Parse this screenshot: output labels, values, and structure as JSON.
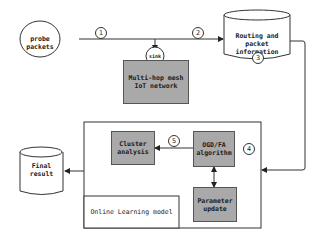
{
  "diagram": {
    "nodes": {
      "probe": {
        "label": "probe packets"
      },
      "sink": {
        "label": "sink"
      },
      "mesh": {
        "label": "Multi-hop mesh\nIoT network"
      },
      "routing": {
        "label": "Routing and packet\ninformation"
      },
      "cluster": {
        "label": "Cluster\nanalysis"
      },
      "ogd": {
        "label": "OGD/FA\nalgorithm"
      },
      "param": {
        "label": "Parameter\nupdate"
      },
      "final": {
        "label": "Final\nresult"
      },
      "model": {
        "label": "Online Learning model"
      }
    },
    "steps": {
      "s1": "1",
      "s2": "2",
      "s3": "3",
      "s4": "4",
      "s5": "5"
    },
    "edges": [
      {
        "from": "probe",
        "to": "sink",
        "step": "1"
      },
      {
        "from": "sink",
        "to": "routing",
        "step": "2"
      },
      {
        "from": "routing",
        "to": "model",
        "step": "4"
      },
      {
        "from": "ogd",
        "to": "cluster",
        "step": "5"
      },
      {
        "from": "ogd",
        "to": "param",
        "bidirectional": true
      },
      {
        "from": "model",
        "to": "final"
      }
    ],
    "colors": {
      "box_fill": "#a9a9a9",
      "stroke": "#333333",
      "background": "#ffffff"
    }
  }
}
